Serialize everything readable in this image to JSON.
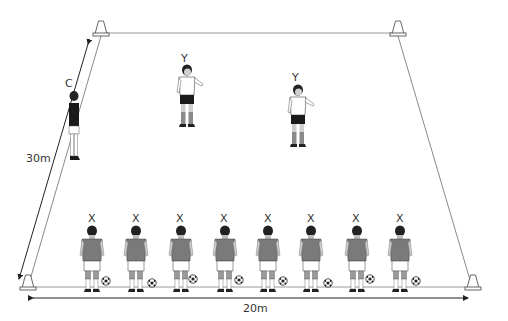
{
  "diagram": {
    "type": "football-drill",
    "pitch": {
      "corners": {
        "top_left": [
          101,
          33
        ],
        "top_right": [
          398,
          33
        ],
        "bottom_left": [
          28,
          287
        ],
        "bottom_right": [
          473,
          287
        ]
      },
      "line_color": "#9a9a9a",
      "cone_color": "#ffffff"
    },
    "dimensions": {
      "width_label": "20m",
      "length_label": "30m"
    },
    "coach": {
      "label": "C",
      "x": 73,
      "y": 90
    },
    "defenders": [
      {
        "label": "Y",
        "x": 186,
        "y": 62
      },
      {
        "label": "Y",
        "x": 297,
        "y": 80
      }
    ],
    "attackers": [
      {
        "label": "X",
        "x": 92
      },
      {
        "label": "X",
        "x": 136
      },
      {
        "label": "X",
        "x": 181
      },
      {
        "label": "X",
        "x": 225
      },
      {
        "label": "X",
        "x": 268
      },
      {
        "label": "X",
        "x": 311
      },
      {
        "label": "X",
        "x": 357
      },
      {
        "label": "X",
        "x": 400
      }
    ],
    "colors": {
      "shirt_attacker": "#7a7a7a",
      "shirt_defender": "#ffffff",
      "shirt_coach": "#1a1a1a",
      "shorts_dark": "#1a1a1a",
      "shorts_light": "#ffffff",
      "skin": "#bdbdbd",
      "hair": "#222222"
    }
  }
}
